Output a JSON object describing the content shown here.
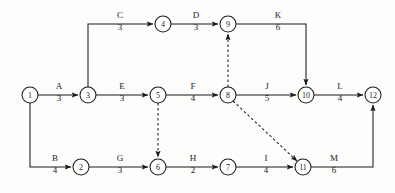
{
  "diagram": {
    "type": "activity-on-arrow-network",
    "title": "",
    "canvas": {
      "width": 395,
      "height": 193
    },
    "colors": {
      "stroke": "#1b1b1b",
      "node_fill": "#ffffff",
      "background": "#fdfdfc"
    },
    "nodes": [
      {
        "id": "1",
        "label": "1",
        "x": 30,
        "y": 95,
        "r": 8
      },
      {
        "id": "2",
        "label": "2",
        "x": 81,
        "y": 167,
        "r": 8
      },
      {
        "id": "3",
        "label": "3",
        "x": 88,
        "y": 95,
        "r": 8
      },
      {
        "id": "4",
        "label": "4",
        "x": 163,
        "y": 24,
        "r": 8
      },
      {
        "id": "5",
        "label": "5",
        "x": 158,
        "y": 95,
        "r": 8
      },
      {
        "id": "6",
        "label": "6",
        "x": 158,
        "y": 167,
        "r": 8
      },
      {
        "id": "7",
        "label": "7",
        "x": 228,
        "y": 167,
        "r": 8
      },
      {
        "id": "8",
        "label": "8",
        "x": 228,
        "y": 95,
        "r": 8
      },
      {
        "id": "9",
        "label": "9",
        "x": 228,
        "y": 24,
        "r": 8
      },
      {
        "id": "10",
        "label": "10",
        "x": 306,
        "y": 95,
        "r": 8
      },
      {
        "id": "11",
        "label": "11",
        "x": 303,
        "y": 167,
        "r": 8
      },
      {
        "id": "12",
        "label": "12",
        "x": 373,
        "y": 95,
        "r": 8
      }
    ],
    "edges": [
      {
        "id": "A",
        "activity": "A",
        "duration": "3",
        "from": "1",
        "to": "3",
        "style": "solid",
        "label_x": 59,
        "label_name_y": 89,
        "label_dur_y": 101
      },
      {
        "id": "B",
        "activity": "B",
        "duration": "4",
        "from": "1",
        "to": "2",
        "style": "solid",
        "label_x": 55,
        "label_name_y": 161,
        "label_dur_y": 173
      },
      {
        "id": "C",
        "activity": "C",
        "duration": "3",
        "from": "3",
        "to": "4",
        "style": "solid",
        "label_x": 120,
        "label_name_y": 18,
        "label_dur_y": 30
      },
      {
        "id": "D",
        "activity": "D",
        "duration": "3",
        "from": "4",
        "to": "9",
        "style": "solid",
        "label_x": 196,
        "label_name_y": 18,
        "label_dur_y": 30
      },
      {
        "id": "E",
        "activity": "E",
        "duration": "3",
        "from": "3",
        "to": "5",
        "style": "solid",
        "label_x": 122,
        "label_name_y": 89,
        "label_dur_y": 101
      },
      {
        "id": "F",
        "activity": "F",
        "duration": "4",
        "from": "5",
        "to": "8",
        "style": "solid",
        "label_x": 193,
        "label_name_y": 89,
        "label_dur_y": 101
      },
      {
        "id": "G",
        "activity": "G",
        "duration": "3",
        "from": "2",
        "to": "6",
        "style": "solid",
        "label_x": 120,
        "label_name_y": 161,
        "label_dur_y": 173
      },
      {
        "id": "H",
        "activity": "H",
        "duration": "2",
        "from": "6",
        "to": "7",
        "style": "solid",
        "label_x": 193,
        "label_name_y": 161,
        "label_dur_y": 173
      },
      {
        "id": "I",
        "activity": "I",
        "duration": "4",
        "from": "7",
        "to": "11",
        "style": "solid",
        "label_x": 266,
        "label_name_y": 161,
        "label_dur_y": 173
      },
      {
        "id": "J",
        "activity": "J",
        "duration": "5",
        "from": "8",
        "to": "10",
        "style": "solid",
        "label_x": 267,
        "label_name_y": 89,
        "label_dur_y": 101
      },
      {
        "id": "K",
        "activity": "K",
        "duration": "6",
        "from": "9",
        "to": "10",
        "style": "solid",
        "label_x": 278,
        "label_name_y": 18,
        "label_dur_y": 30
      },
      {
        "id": "L",
        "activity": "L",
        "duration": "4",
        "from": "10",
        "to": "12",
        "style": "solid",
        "label_x": 340,
        "label_name_y": 89,
        "label_dur_y": 101
      },
      {
        "id": "M",
        "activity": "M",
        "duration": "6",
        "from": "11",
        "to": "12",
        "style": "solid",
        "label_x": 334,
        "label_name_y": 161,
        "label_dur_y": 173
      }
    ],
    "dummies": [
      {
        "id": "dummy-8-9",
        "from": "8",
        "to": "9",
        "style": "dashed"
      },
      {
        "id": "dummy-5-6",
        "from": "5",
        "to": "6",
        "style": "dashed"
      },
      {
        "id": "dummy-8-11",
        "from": "8",
        "to": "11",
        "style": "dashed"
      }
    ]
  }
}
